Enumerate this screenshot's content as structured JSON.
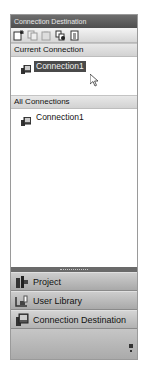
{
  "panel": {
    "title": "Connection Destination"
  },
  "toolbar": {
    "buttons": [
      {
        "name": "new-connection",
        "icon": "new-document-icon",
        "enabled": true
      },
      {
        "name": "copy",
        "icon": "copy-icon",
        "enabled": false
      },
      {
        "name": "paste",
        "icon": "paste-icon",
        "enabled": false
      },
      {
        "name": "connect",
        "icon": "connect-icon",
        "enabled": true
      },
      {
        "name": "list",
        "icon": "list-document-icon",
        "enabled": true
      }
    ]
  },
  "current_connection": {
    "header": "Current Connection",
    "items": [
      {
        "label": "Connection1",
        "icon": "connection-icon",
        "selected": true
      }
    ]
  },
  "all_connections": {
    "header": "All Connections",
    "items": [
      {
        "label": "Connection1",
        "icon": "connection-icon",
        "selected": false
      }
    ]
  },
  "navigation": {
    "items": [
      {
        "label": "Project",
        "icon": "project-icon"
      },
      {
        "label": "User Library",
        "icon": "user-library-icon"
      },
      {
        "label": "Connection Destination",
        "icon": "connection-destination-icon"
      }
    ]
  },
  "colors": {
    "titlebar": "#5a5a5a",
    "selection": "#4a4a4a",
    "nav_button": "#bcbcbc"
  }
}
